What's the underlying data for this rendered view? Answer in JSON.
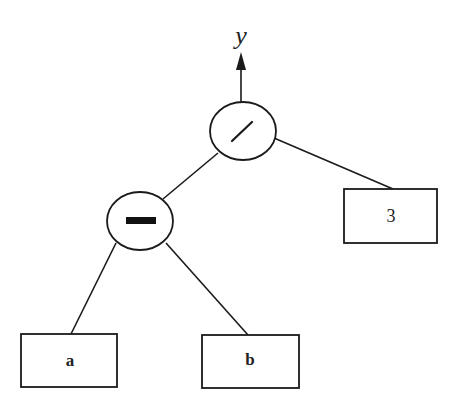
{
  "diagram": {
    "type": "expression-tree",
    "colors": {
      "stroke": "#1a1a1a",
      "fill": "#ffffff",
      "text": "#222222",
      "background": "#ffffff"
    },
    "output": {
      "label": "y",
      "arrow": "up"
    },
    "nodes": [
      {
        "id": "div",
        "kind": "operator",
        "symbol": "/",
        "shape": "circle"
      },
      {
        "id": "sub",
        "kind": "operator",
        "symbol": "−",
        "shape": "circle"
      },
      {
        "id": "three",
        "kind": "operand",
        "label": "3",
        "shape": "rectangle"
      },
      {
        "id": "a",
        "kind": "operand",
        "label": "a",
        "shape": "rectangle"
      },
      {
        "id": "b",
        "kind": "operand",
        "label": "b",
        "shape": "rectangle"
      }
    ],
    "edges": [
      {
        "from": "div",
        "to": "sub"
      },
      {
        "from": "div",
        "to": "three"
      },
      {
        "from": "sub",
        "to": "a"
      },
      {
        "from": "sub",
        "to": "b"
      },
      {
        "from": "div",
        "to": "output"
      }
    ],
    "expression": "y = (a − b) / 3"
  }
}
